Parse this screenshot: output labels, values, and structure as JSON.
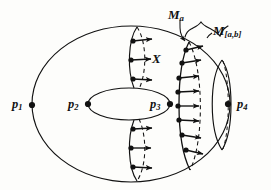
{
  "figure": {
    "type": "mathematical-diagram",
    "background_color": "#fdfdfb",
    "ink_color": "#111111",
    "width": 271,
    "height": 190
  },
  "labels": {
    "p1": {
      "base": "p",
      "sub": "1",
      "x": 12,
      "y": 99
    },
    "p2": {
      "base": "p",
      "sub": "2",
      "x": 68,
      "y": 99
    },
    "p3": {
      "base": "p",
      "sub": "3",
      "x": 150,
      "y": 99
    },
    "p4": {
      "base": "p",
      "sub": "4",
      "x": 237,
      "y": 99
    },
    "vector_field": {
      "base": "X",
      "sub": "",
      "x": 152,
      "y": 52
    },
    "level_set_a": {
      "base": "M",
      "sub": "a",
      "x": 168,
      "y": 8
    },
    "level_region_ab": {
      "base": "M",
      "sub": "[a,b]",
      "x": 213,
      "y": 24
    }
  },
  "marked_points": [
    {
      "name": "p1",
      "cx": 32,
      "cy": 105
    },
    {
      "name": "p2",
      "cx": 88,
      "cy": 104
    },
    {
      "name": "p3",
      "cx": 170,
      "cy": 104
    },
    {
      "name": "p4",
      "cx": 228,
      "cy": 104
    }
  ],
  "vector_field_arrows": {
    "upper_left_cluster": [
      {
        "x": 133,
        "y": 41
      },
      {
        "x": 131,
        "y": 60
      },
      {
        "x": 133,
        "y": 79
      }
    ],
    "lower_left_cluster": [
      {
        "x": 133,
        "y": 129
      },
      {
        "x": 131,
        "y": 148
      },
      {
        "x": 133,
        "y": 167
      }
    ],
    "center_arc_cluster": [
      {
        "x": 186,
        "y": 50
      },
      {
        "x": 182,
        "y": 63
      },
      {
        "x": 179,
        "y": 78
      },
      {
        "x": 178,
        "y": 92
      },
      {
        "x": 178,
        "y": 106
      },
      {
        "x": 179,
        "y": 120
      },
      {
        "x": 182,
        "y": 135
      },
      {
        "x": 186,
        "y": 150
      }
    ]
  },
  "curves": {
    "outer_boundary": "large ellipse",
    "inner_hole": "small ellipse",
    "level_set_a_arc": "solid vertical arc with dashed back arc",
    "left_meridian": "solid arc upper and lower with dashed back arcs",
    "right_lens": "lens shape near p4 with dashed back arc",
    "brace": "curly brace over the M[a,b] region"
  }
}
